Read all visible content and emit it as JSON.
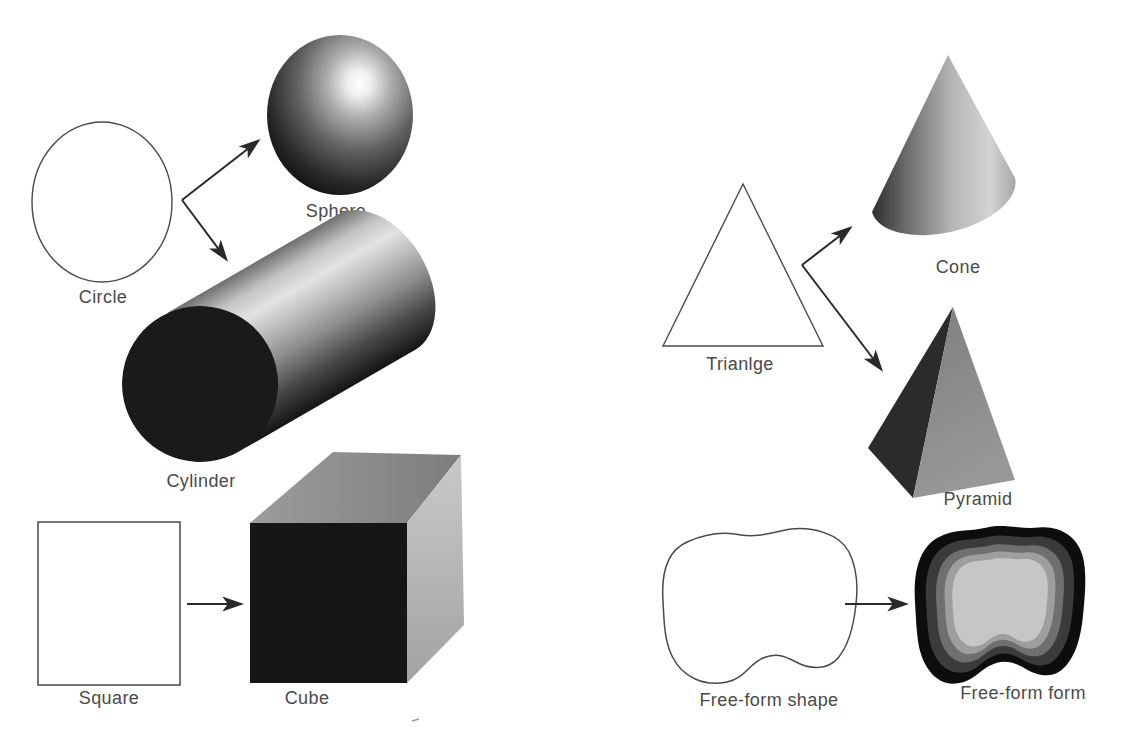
{
  "diagram": {
    "labels": {
      "circle": "Circle",
      "sphere": "Sphere",
      "cylinder": "Cylinder",
      "square": "Square",
      "cube": "Cube",
      "triangle": "Trianlge",
      "cone": "Cone",
      "pyramid": "Pyramid",
      "freeform_shape": "Free-form shape",
      "freeform_form": "Free-form form"
    },
    "relations": [
      {
        "from": "Circle",
        "to": [
          "Sphere",
          "Cylinder"
        ]
      },
      {
        "from": "Square",
        "to": [
          "Cube"
        ]
      },
      {
        "from": "Trianlge",
        "to": [
          "Cone",
          "Pyramid"
        ]
      },
      {
        "from": "Free-form shape",
        "to": [
          "Free-form form"
        ]
      }
    ],
    "colors": {
      "background": "#ffffff",
      "outline_stroke": "#4a4a4a",
      "label_text": "#4a4a4a",
      "arrow": "#2a2a2a",
      "dark_fill": "#181818",
      "mid_gray": "#8c8c8c",
      "light_gray": "#c6c6c6",
      "highlight": "#ffffff"
    }
  }
}
